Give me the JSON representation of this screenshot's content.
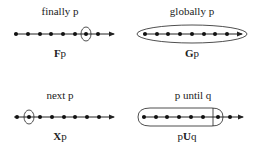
{
  "panels": [
    {
      "id": "finally",
      "title": "finally p",
      "formula_op": "F",
      "formula_arg": "p",
      "highlight": "single-state",
      "highlighted_index": 6
    },
    {
      "id": "globally",
      "title": "globally p",
      "formula_op": "G",
      "formula_arg": "p",
      "highlight": "all-states"
    },
    {
      "id": "next",
      "title": "next p",
      "formula_op": "X",
      "formula_arg": "p",
      "highlight": "single-state",
      "highlighted_index": 1
    },
    {
      "id": "until",
      "title": "p until q",
      "formula_left": "p",
      "formula_op": "U",
      "formula_arg": "q",
      "highlight": "prefix-until",
      "highlighted_until_index": 6
    }
  ],
  "states_per_timeline": 8,
  "colors": {
    "stroke": "#222222",
    "dot": "#111111",
    "background": "#ffffff"
  }
}
